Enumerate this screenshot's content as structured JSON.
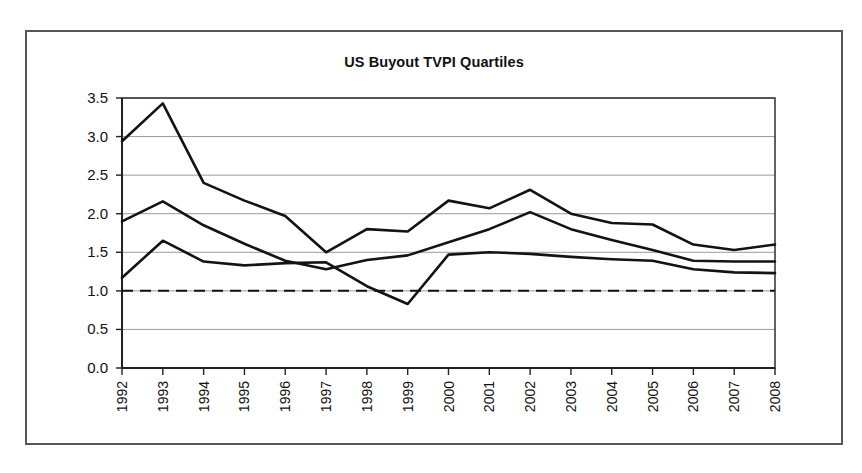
{
  "chart_data": {
    "type": "line",
    "title": "US Buyout TVPI Quartiles",
    "xlabel": "",
    "ylabel": "",
    "categories": [
      "1992",
      "1993",
      "1994",
      "1995",
      "1996",
      "1997",
      "1998",
      "1999",
      "2000",
      "2001",
      "2002",
      "2003",
      "2004",
      "2005",
      "2006",
      "2007",
      "2008"
    ],
    "ylim": [
      0.0,
      3.5
    ],
    "ytick_labels": [
      "0.0",
      "0.5",
      "1.0",
      "1.5",
      "2.0",
      "2.5",
      "3.0",
      "3.5"
    ],
    "ytick_values": [
      0.0,
      0.5,
      1.0,
      1.5,
      2.0,
      2.5,
      3.0,
      3.5
    ],
    "grid": true,
    "legend": "none",
    "series": [
      {
        "name": "upper-quartile",
        "values": [
          2.94,
          3.43,
          2.4,
          2.17,
          1.97,
          1.5,
          1.8,
          1.77,
          2.17,
          2.07,
          2.31,
          2.0,
          1.88,
          1.86,
          1.6,
          1.53,
          1.6
        ]
      },
      {
        "name": "median",
        "values": [
          1.9,
          2.16,
          1.85,
          1.61,
          1.39,
          1.28,
          1.4,
          1.46,
          1.63,
          1.8,
          2.02,
          1.8,
          1.66,
          1.53,
          1.39,
          1.38,
          1.38
        ]
      },
      {
        "name": "lower-quartile",
        "values": [
          1.17,
          1.65,
          1.38,
          1.33,
          1.36,
          1.37,
          1.06,
          0.83,
          1.47,
          1.5,
          1.48,
          1.44,
          1.41,
          1.39,
          1.28,
          1.24,
          1.23
        ]
      }
    ],
    "reference_line": {
      "name": "break-even-line",
      "value": 1.0,
      "style": "dashed"
    }
  }
}
